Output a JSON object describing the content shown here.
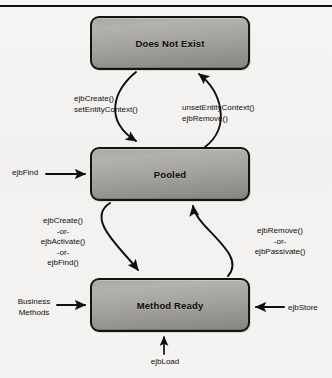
{
  "diagram": {
    "type": "state-diagram",
    "background_color": "#f4f3f1",
    "box_fill_color": "#a3a19c",
    "box_border_color": "#16140f",
    "stroke_color": "#100f0d",
    "states": [
      {
        "id": "does-not-exist",
        "label": "Does Not Exist"
      },
      {
        "id": "pooled",
        "label": "Pooled"
      },
      {
        "id": "method-ready",
        "label": "Method Ready"
      }
    ],
    "transitions": [
      {
        "id": "create-setcontext",
        "from": "does-not-exist",
        "to": "pooled",
        "label": "ejbCreate()\nsetEntityContext()"
      },
      {
        "id": "unset-remove",
        "from": "pooled",
        "to": "does-not-exist",
        "label": "unsetEntityContext()\nejbRemove()"
      },
      {
        "id": "ejbfind-external",
        "from": "external",
        "to": "pooled",
        "label": "ejbFind"
      },
      {
        "id": "create-activate-find",
        "from": "pooled",
        "to": "method-ready",
        "label": "ejbCreate()\n-or-\nejbActivate()\n-or-\nejbFind()"
      },
      {
        "id": "remove-passivate",
        "from": "method-ready",
        "to": "pooled",
        "label": "ejbRemove()\n-or-\nejbPassivate()"
      },
      {
        "id": "business-methods",
        "from": "external",
        "to": "method-ready",
        "label": "Business\nMethods"
      },
      {
        "id": "ejbstore",
        "from": "external",
        "to": "method-ready",
        "label": "ejbStore"
      },
      {
        "id": "ejbload",
        "from": "external",
        "to": "method-ready",
        "label": "ejbLoad"
      }
    ]
  }
}
